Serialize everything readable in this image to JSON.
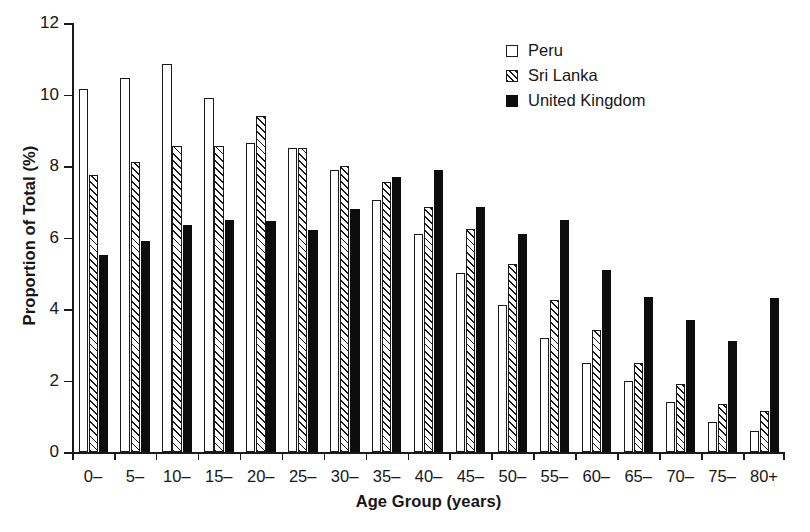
{
  "chart_data": {
    "type": "bar",
    "title": "",
    "xlabel": "Age Group (years)",
    "ylabel": "Proportion of Total (%)",
    "ylim": [
      0,
      12
    ],
    "yticks": [
      0,
      2,
      4,
      6,
      8,
      10,
      12
    ],
    "grid": false,
    "legend_position": "top-right",
    "categories": [
      "0–",
      "5–",
      "10–",
      "15–",
      "20–",
      "25–",
      "30–",
      "35–",
      "40–",
      "45–",
      "50–",
      "55–",
      "60–",
      "65–",
      "70–",
      "75–",
      "80+"
    ],
    "series": [
      {
        "name": "Peru",
        "style": "open",
        "color": "#ffffff",
        "values": [
          10.15,
          10.45,
          10.85,
          9.9,
          8.65,
          8.5,
          7.9,
          7.05,
          6.1,
          5.0,
          4.1,
          3.2,
          2.5,
          2.0,
          1.4,
          0.85,
          0.6
        ]
      },
      {
        "name": "Sri Lanka",
        "style": "hatched",
        "color": "#ffffff",
        "values": [
          7.75,
          8.1,
          8.55,
          8.55,
          9.4,
          8.5,
          8.0,
          7.55,
          6.85,
          6.25,
          5.25,
          4.25,
          3.4,
          2.5,
          1.9,
          1.35,
          1.15
        ]
      },
      {
        "name": "United Kingdom",
        "style": "filled",
        "color": "#0d0d0d",
        "values": [
          5.5,
          5.9,
          6.35,
          6.5,
          6.45,
          6.2,
          6.8,
          7.7,
          7.9,
          6.85,
          6.1,
          6.5,
          5.1,
          4.35,
          3.7,
          3.1,
          4.3
        ]
      }
    ]
  },
  "legend": {
    "items": [
      {
        "label": "Peru",
        "swatch": "open-square-icon"
      },
      {
        "label": "Sri Lanka",
        "swatch": "hatched-square-icon"
      },
      {
        "label": "United Kingdom",
        "swatch": "filled-square-icon"
      }
    ]
  }
}
